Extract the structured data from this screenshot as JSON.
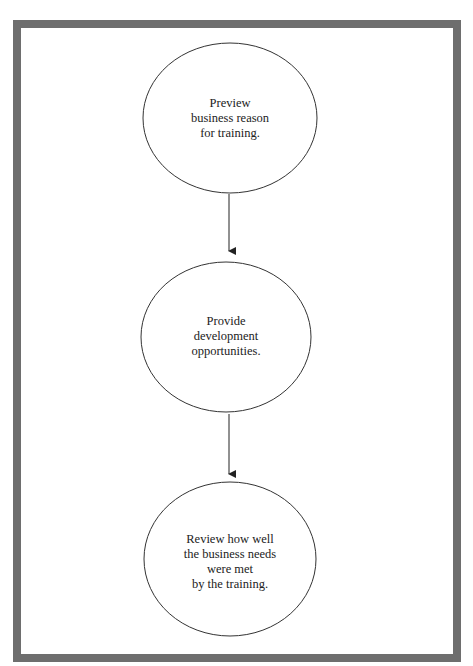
{
  "diagram": {
    "type": "vertical-flowchart",
    "nodes": [
      {
        "id": "preview",
        "lines": [
          "Preview",
          "business reason",
          "for training."
        ]
      },
      {
        "id": "provide",
        "lines": [
          "Provide",
          "development",
          "opportunities."
        ]
      },
      {
        "id": "review",
        "lines": [
          "Review how well",
          "the business needs",
          "were met",
          "by the training."
        ]
      }
    ],
    "edges": [
      {
        "from": "preview",
        "to": "provide"
      },
      {
        "from": "provide",
        "to": "review"
      }
    ],
    "colors": {
      "frame": "#6e6e6e",
      "stroke": "#222222",
      "text": "#222222"
    }
  }
}
